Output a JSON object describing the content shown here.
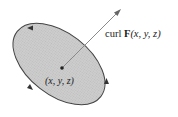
{
  "diagram": {
    "type": "surface-with-curl-vector",
    "colors": {
      "surface_fill": "#c8c8c8",
      "boundary_stroke": "#444444",
      "arrow_stroke": "#8a8a8a",
      "text": "#222222"
    },
    "surface": {
      "shape": "ellipse",
      "cx": 59,
      "cy": 64,
      "rx": 53,
      "ry": 31,
      "rotation_deg": 38
    },
    "center_point": {
      "x": 62,
      "y": 68
    },
    "vector_tip": {
      "x": 121,
      "y": 9
    },
    "labels": {
      "curl_prefix": "curl ",
      "curl_F": "F",
      "curl_args": "(x, y, z)",
      "point_label": "(x, y, z)"
    },
    "boundary_arrows": [
      {
        "x": 31,
        "y": 28,
        "direction": "left"
      },
      {
        "x": 106,
        "y": 82,
        "direction": "up"
      },
      {
        "x": 30,
        "y": 88,
        "direction": "down-right"
      }
    ]
  }
}
